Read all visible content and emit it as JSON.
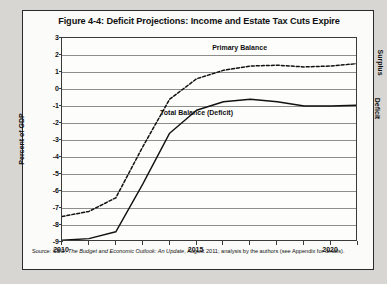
{
  "figure": {
    "title": "Figure 4-4: Deficit Projections: Income and Estate Tax Cuts Expire",
    "source_prefix": "Source: CBO, ",
    "source_italic": "The Budget and Economic Outlook: An Update",
    "source_suffix": ", August 2011; analysis by the authors (see Appendix for details).",
    "side_labels": {
      "surplus": "Surplus",
      "deficit": "Deficit"
    }
  },
  "chart_data": {
    "type": "line",
    "title": "Figure 4-4: Deficit Projections: Income and Estate Tax Cuts Expire",
    "xlabel": "",
    "ylabel": "Percent of GDP",
    "xlim": [
      2010,
      2021
    ],
    "ylim": [
      -9,
      3
    ],
    "yticks": [
      3,
      2,
      1,
      0,
      -1,
      -2,
      -3,
      -4,
      -5,
      -6,
      -7,
      -8,
      -9
    ],
    "ytick_labels": [
      "3",
      "2",
      "1",
      "0",
      "-1",
      "-2",
      "-3",
      "-4",
      "-5",
      "-6",
      "-7",
      "-8",
      "-9"
    ],
    "xticks": [
      2010,
      2011,
      2012,
      2013,
      2014,
      2015,
      2016,
      2017,
      2018,
      2019,
      2020,
      2021
    ],
    "xtick_labels_shown": [
      "2010",
      "2015",
      "2020"
    ],
    "xtick_labels_shown_values": [
      2010,
      2015,
      2020
    ],
    "grid": true,
    "grid_axis": "y",
    "legend": "inline-annotations",
    "x": [
      2010,
      2011,
      2012,
      2013,
      2014,
      2015,
      2016,
      2017,
      2018,
      2019,
      2020,
      2021
    ],
    "series": [
      {
        "name": "Primary Balance",
        "style": "dashed",
        "color": "#111111",
        "label_x": 2016.6,
        "label_y": 2.35,
        "values": [
          -7.5,
          -7.2,
          -6.4,
          -3.4,
          -0.6,
          0.6,
          1.1,
          1.35,
          1.4,
          1.3,
          1.35,
          1.5
        ]
      },
      {
        "name": "Total Balance (Deficit)",
        "style": "solid",
        "color": "#111111",
        "label_x": 2015.0,
        "label_y": -1.45,
        "values": [
          -8.9,
          -8.8,
          -8.4,
          -5.6,
          -2.6,
          -1.25,
          -0.75,
          -0.6,
          -0.75,
          -1.0,
          -1.0,
          -0.95
        ]
      }
    ]
  }
}
